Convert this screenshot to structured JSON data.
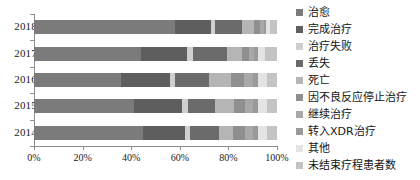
{
  "chart_data": {
    "type": "bar",
    "orientation": "horizontal",
    "stacked": true,
    "normalized_percent": true,
    "title": "",
    "xlabel": "",
    "ylabel": "",
    "xlim": [
      0,
      100
    ],
    "xticks": [
      "0%",
      "20%",
      "40%",
      "60%",
      "80%",
      "100%"
    ],
    "xtick_values": [
      0,
      20,
      40,
      60,
      80,
      100
    ],
    "grid": false,
    "legend_position": "right",
    "categories": [
      "2018",
      "2017",
      "2016",
      "2015",
      "2014"
    ],
    "series": [
      {
        "name": "治愈",
        "color": "#7b7b7b",
        "values": [
          58.0,
          44.0,
          36.0,
          41.0,
          45.0
        ]
      },
      {
        "name": "完成治疗",
        "color": "#5e5e5e",
        "values": [
          15.0,
          19.0,
          20.0,
          20.0,
          17.0
        ]
      },
      {
        "name": "治疗失败",
        "color": "#cfcfcf",
        "values": [
          1.5,
          2.5,
          2.0,
          2.5,
          2.0
        ]
      },
      {
        "name": "丢失",
        "color": "#6b6b6b",
        "values": [
          11.0,
          14.0,
          14.0,
          11.0,
          12.0
        ]
      },
      {
        "name": "死亡",
        "color": "#b5b5b5",
        "values": [
          5.0,
          6.0,
          9.0,
          8.0,
          6.0
        ]
      },
      {
        "name": "因不良反应停止治疗",
        "color": "#8f8f8f",
        "values": [
          2.5,
          3.0,
          5.5,
          4.5,
          5.0
        ]
      },
      {
        "name": "继续治疗",
        "color": "#a8a8a8",
        "values": [
          1.5,
          2.0,
          3.5,
          3.0,
          3.0
        ]
      },
      {
        "name": "转入XDR治疗",
        "color": "#9a9a9a",
        "values": [
          1.0,
          1.5,
          2.0,
          2.0,
          2.0
        ]
      },
      {
        "name": "其他",
        "color": "#e4e4e4",
        "values": [
          1.5,
          3.0,
          4.0,
          4.0,
          4.0
        ]
      },
      {
        "name": "未结束疗程患者数",
        "color": "#c4c4c4",
        "values": [
          3.0,
          5.0,
          4.0,
          4.0,
          4.0
        ]
      }
    ]
  },
  "axis": {
    "y_labels": [
      "2018",
      "2017",
      "2016",
      "2015",
      "2014"
    ],
    "x_labels": [
      "0%",
      "20%",
      "40%",
      "60%",
      "80%",
      "100%"
    ]
  },
  "legend": {
    "items": [
      {
        "label": "治愈"
      },
      {
        "label": "完成治疗"
      },
      {
        "label": "治疗失败"
      },
      {
        "label": "丢失"
      },
      {
        "label": "死亡"
      },
      {
        "label": "因不良反应停止治疗"
      },
      {
        "label": "继续治疗"
      },
      {
        "label": "转入XDR治疗"
      },
      {
        "label": "其他"
      },
      {
        "label": "未结束疗程患者数"
      }
    ]
  }
}
